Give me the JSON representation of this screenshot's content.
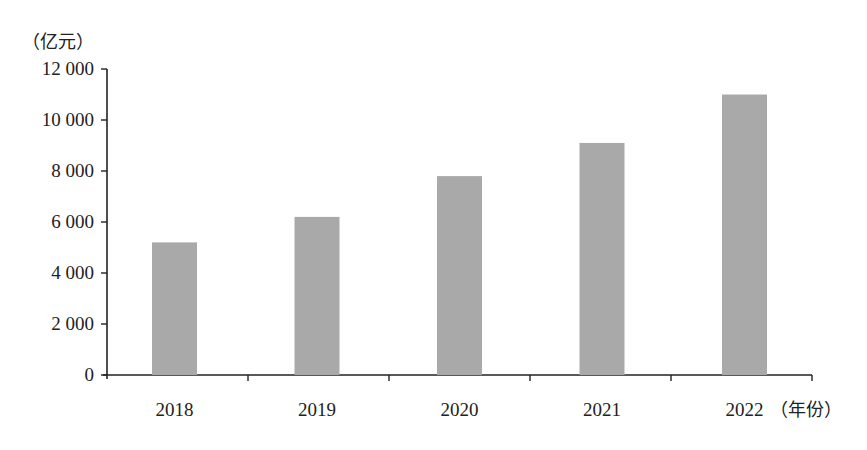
{
  "chart_data": {
    "type": "bar",
    "title": "",
    "xlabel": "（年份）",
    "ylabel": "（亿元）",
    "categories": [
      "2018",
      "2019",
      "2020",
      "2021",
      "2022"
    ],
    "values": [
      5200,
      6200,
      7800,
      9100,
      11000
    ],
    "ylim": [
      0,
      12000
    ],
    "yticks": [
      0,
      2000,
      4000,
      6000,
      8000,
      10000,
      12000
    ],
    "ytick_labels": [
      "0",
      "2 000",
      "4 000",
      "6 000",
      "8 000",
      "10 000",
      "12 000"
    ],
    "grid": false,
    "legend": null,
    "bar_color": "#a9a9a9",
    "axis_color": "#222222"
  }
}
